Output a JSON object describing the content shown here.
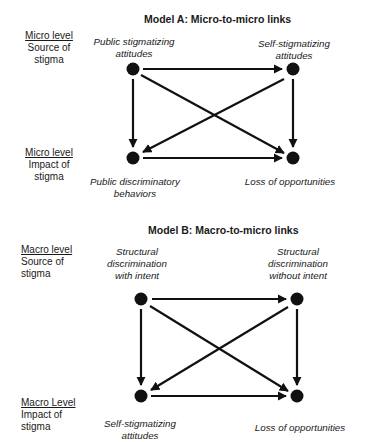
{
  "model_a": {
    "title": "Model A: Micro-to-micro links",
    "source_level": {
      "heading": "Micro level",
      "line1": "Source of",
      "line2": "stigma"
    },
    "impact_level": {
      "heading": "Micro level",
      "line1": "Impact of",
      "line2": "stigma"
    },
    "nodes": {
      "top_left": {
        "line1": "Public stigmatizing",
        "line2": "attitudes"
      },
      "top_right": {
        "line1": "Self-stigmatizing",
        "line2": "attitudes"
      },
      "bottom_left": {
        "line1": "Public discriminatory",
        "line2": "behaviors"
      },
      "bottom_right": {
        "line1": "Loss of opportunities",
        "line2": ""
      }
    },
    "edges": [
      [
        "top_left",
        "top_right"
      ],
      [
        "top_left",
        "bottom_left"
      ],
      [
        "top_left",
        "bottom_right"
      ],
      [
        "top_right",
        "bottom_left"
      ],
      [
        "top_right",
        "bottom_right"
      ],
      [
        "bottom_left",
        "bottom_right"
      ]
    ]
  },
  "model_b": {
    "title": "Model B: Macro-to-micro links",
    "source_level": {
      "heading": "Macro level",
      "line1": "Source of",
      "line2": "stigma"
    },
    "impact_level": {
      "heading": "Macro Level",
      "line1": "Impact of",
      "line2": "stigma"
    },
    "nodes": {
      "top_left": {
        "line1": "Structural",
        "line2": "discrimination",
        "line3": "with intent"
      },
      "top_right": {
        "line1": "Structural",
        "line2": "discrimination",
        "line3": "without intent"
      },
      "bottom_left": {
        "line1": "Self-stigmatizing",
        "line2": "attitudes"
      },
      "bottom_right": {
        "line1": "Loss of opportunities",
        "line2": ""
      }
    },
    "edges": [
      [
        "top_left",
        "top_right"
      ],
      [
        "top_left",
        "bottom_left"
      ],
      [
        "top_left",
        "bottom_right"
      ],
      [
        "top_right",
        "bottom_left"
      ],
      [
        "top_right",
        "bottom_right"
      ],
      [
        "bottom_left",
        "bottom_right"
      ]
    ]
  },
  "colors": {
    "ink": "#111111",
    "background": "#ffffff"
  }
}
